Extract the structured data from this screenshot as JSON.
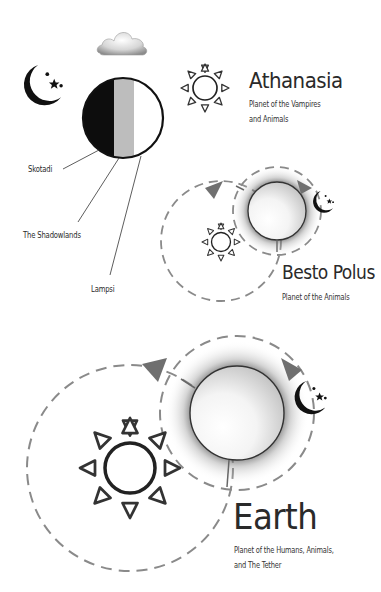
{
  "header": {
    "title_cropped": ""
  },
  "colors": {
    "ink": "#1a1a1a",
    "orbit": "#8a8a8a",
    "arrow": "#707070",
    "shadow_band": "#bdbdbd",
    "background": "#ffffff"
  },
  "icons": {
    "cloud": "cloud-icon",
    "moon": "crescent-moon-stars-icon",
    "sun": "sun-icon"
  },
  "athanasia": {
    "name": "Athanasia",
    "subtitle_line1": "Planet of the Vampires",
    "subtitle_line2": "and Animals",
    "regions": [
      {
        "label": "Skotadi",
        "shade": "black"
      },
      {
        "label": "The Shadowlands",
        "shade": "gray"
      },
      {
        "label": "Lampsi",
        "shade": "white"
      }
    ]
  },
  "besto_polus": {
    "name": "Besto Polus",
    "subtitle": "Planet of the Animals"
  },
  "earth": {
    "name": "Earth",
    "subtitle_line1": "Planet of the Humans, Animals,",
    "subtitle_line2": "and The Tether"
  }
}
